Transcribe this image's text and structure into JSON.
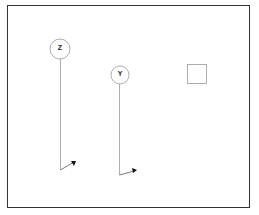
{
  "diagram": {
    "nodes": [
      {
        "id": "z",
        "label": "Z",
        "cx": 60,
        "cy": 49,
        "r": 10
      },
      {
        "id": "y",
        "label": "Y",
        "cx": 120,
        "cy": 75,
        "r": 9
      }
    ],
    "square": {
      "x": 188,
      "y": 64,
      "size": 19
    },
    "colors": {
      "stroke": "#888888",
      "frame": "#333333",
      "arrow": "#111111"
    }
  }
}
